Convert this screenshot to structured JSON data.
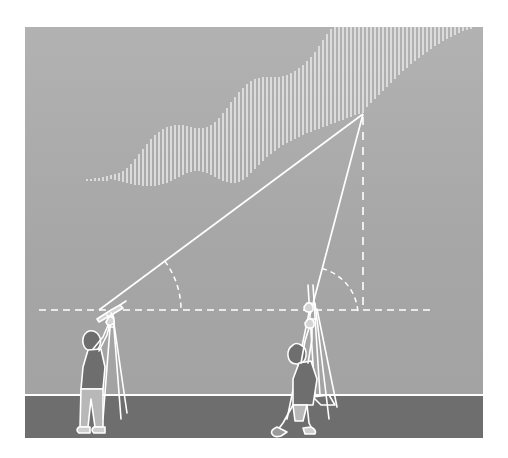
{
  "figure": {
    "background_color": "#a8a8a8",
    "sky_color": "#a8a8a8",
    "ground_color": "#6e6e6e",
    "line_color": "#ffffff",
    "hatch_color": "#e8e8e8",
    "canvas": {
      "width": 458,
      "height": 411,
      "offset_x": 25,
      "offset_y": 27
    }
  },
  "geometry": {
    "target_point": {
      "x": 338,
      "y": 87
    },
    "ground_line_y": 368,
    "horizontal_eye_line_y": 283,
    "horizontal_eye_line_x1": 14,
    "horizontal_eye_line_x2": 406,
    "vertical_drop_x": 338,
    "vertical_drop_y1": 90,
    "vertical_drop_y2": 283,
    "sightline_left": {
      "x1": 74,
      "y1": 283,
      "x2": 338,
      "y2": 87
    },
    "sightline_right": {
      "x1": 285,
      "y1": 288,
      "x2": 338,
      "y2": 87
    },
    "angle_arc_left": {
      "cx": 74,
      "cy": 283,
      "r": 82,
      "label": "elevation angle A"
    },
    "angle_arc_right": {
      "cx": 285,
      "cy": 288,
      "r": 48,
      "label": "elevation angle B"
    }
  },
  "surveyors": [
    {
      "id": "left-surveyor",
      "label": "Surveyor with transit on tripod",
      "instrument": "theodolite-transit",
      "base_x": 72,
      "base_y": 368,
      "shirt_color": "#6e6e6e"
    },
    {
      "id": "right-surveyor",
      "label": "Surveyor with leveling rod and tripod",
      "instrument": "leveling-rod",
      "base_x": 285,
      "base_y": 368,
      "shirt_color": "#6e6e6e"
    }
  ],
  "hillside": {
    "label": "Hatched hillside profile",
    "hatch_spacing": 4,
    "hatch_width": 1.6,
    "profile": [
      {
        "x": 86,
        "top": 148,
        "bottom": 152
      },
      {
        "x": 90,
        "top": 147,
        "bottom": 153
      },
      {
        "x": 94,
        "top": 146,
        "bottom": 154
      },
      {
        "x": 98,
        "top": 144,
        "bottom": 155
      },
      {
        "x": 102,
        "top": 141,
        "bottom": 156
      },
      {
        "x": 106,
        "top": 137,
        "bottom": 157
      },
      {
        "x": 110,
        "top": 132,
        "bottom": 158
      },
      {
        "x": 114,
        "top": 127,
        "bottom": 158
      },
      {
        "x": 118,
        "top": 122,
        "bottom": 159
      },
      {
        "x": 122,
        "top": 117,
        "bottom": 159
      },
      {
        "x": 126,
        "top": 112,
        "bottom": 159
      },
      {
        "x": 130,
        "top": 108,
        "bottom": 159
      },
      {
        "x": 134,
        "top": 105,
        "bottom": 158
      },
      {
        "x": 138,
        "top": 102,
        "bottom": 157
      },
      {
        "x": 142,
        "top": 100,
        "bottom": 156
      },
      {
        "x": 146,
        "top": 99,
        "bottom": 154
      },
      {
        "x": 150,
        "top": 98,
        "bottom": 152
      },
      {
        "x": 154,
        "top": 98,
        "bottom": 150
      },
      {
        "x": 158,
        "top": 98,
        "bottom": 148
      },
      {
        "x": 162,
        "top": 99,
        "bottom": 146
      },
      {
        "x": 166,
        "top": 100,
        "bottom": 145
      },
      {
        "x": 170,
        "top": 101,
        "bottom": 144
      },
      {
        "x": 174,
        "top": 101,
        "bottom": 144
      },
      {
        "x": 178,
        "top": 101,
        "bottom": 145
      },
      {
        "x": 182,
        "top": 100,
        "bottom": 146
      },
      {
        "x": 186,
        "top": 98,
        "bottom": 148
      },
      {
        "x": 190,
        "top": 95,
        "bottom": 150
      },
      {
        "x": 194,
        "top": 91,
        "bottom": 152
      },
      {
        "x": 198,
        "top": 86,
        "bottom": 154
      },
      {
        "x": 202,
        "top": 81,
        "bottom": 155
      },
      {
        "x": 206,
        "top": 75,
        "bottom": 156
      },
      {
        "x": 210,
        "top": 70,
        "bottom": 156
      },
      {
        "x": 214,
        "top": 65,
        "bottom": 155
      },
      {
        "x": 218,
        "top": 61,
        "bottom": 153
      },
      {
        "x": 222,
        "top": 57,
        "bottom": 150
      },
      {
        "x": 226,
        "top": 54,
        "bottom": 146
      },
      {
        "x": 230,
        "top": 52,
        "bottom": 142
      },
      {
        "x": 234,
        "top": 51,
        "bottom": 138
      },
      {
        "x": 238,
        "top": 50,
        "bottom": 134
      },
      {
        "x": 242,
        "top": 50,
        "bottom": 130
      },
      {
        "x": 246,
        "top": 50,
        "bottom": 127
      },
      {
        "x": 250,
        "top": 50,
        "bottom": 124
      },
      {
        "x": 254,
        "top": 50,
        "bottom": 121
      },
      {
        "x": 258,
        "top": 49,
        "bottom": 118
      },
      {
        "x": 262,
        "top": 48,
        "bottom": 116
      },
      {
        "x": 266,
        "top": 46,
        "bottom": 114
      },
      {
        "x": 270,
        "top": 44,
        "bottom": 112
      },
      {
        "x": 274,
        "top": 41,
        "bottom": 110
      },
      {
        "x": 278,
        "top": 38,
        "bottom": 108
      },
      {
        "x": 282,
        "top": 34,
        "bottom": 106
      },
      {
        "x": 286,
        "top": 30,
        "bottom": 105
      },
      {
        "x": 290,
        "top": 25,
        "bottom": 103
      },
      {
        "x": 294,
        "top": 19,
        "bottom": 102
      },
      {
        "x": 298,
        "top": 13,
        "bottom": 100
      },
      {
        "x": 302,
        "top": 7,
        "bottom": 99
      },
      {
        "x": 306,
        "top": 2,
        "bottom": 97
      },
      {
        "x": 310,
        "top": 0,
        "bottom": 96
      },
      {
        "x": 314,
        "top": 0,
        "bottom": 94
      },
      {
        "x": 318,
        "top": 0,
        "bottom": 93
      },
      {
        "x": 322,
        "top": 0,
        "bottom": 91
      },
      {
        "x": 326,
        "top": 0,
        "bottom": 90
      },
      {
        "x": 330,
        "top": 0,
        "bottom": 88
      },
      {
        "x": 334,
        "top": 0,
        "bottom": 87
      },
      {
        "x": 338,
        "top": 0,
        "bottom": 86
      },
      {
        "x": 342,
        "top": 0,
        "bottom": 80
      },
      {
        "x": 346,
        "top": 0,
        "bottom": 76
      },
      {
        "x": 350,
        "top": 0,
        "bottom": 72
      },
      {
        "x": 354,
        "top": 0,
        "bottom": 68
      },
      {
        "x": 358,
        "top": 0,
        "bottom": 64
      },
      {
        "x": 362,
        "top": 0,
        "bottom": 60
      },
      {
        "x": 366,
        "top": 0,
        "bottom": 56
      },
      {
        "x": 370,
        "top": 0,
        "bottom": 52
      },
      {
        "x": 374,
        "top": 0,
        "bottom": 48
      },
      {
        "x": 378,
        "top": 0,
        "bottom": 44
      },
      {
        "x": 382,
        "top": 0,
        "bottom": 41
      },
      {
        "x": 386,
        "top": 0,
        "bottom": 37
      },
      {
        "x": 390,
        "top": 0,
        "bottom": 34
      },
      {
        "x": 394,
        "top": 0,
        "bottom": 31
      },
      {
        "x": 398,
        "top": 0,
        "bottom": 28
      },
      {
        "x": 402,
        "top": 0,
        "bottom": 25
      },
      {
        "x": 406,
        "top": 0,
        "bottom": 22
      },
      {
        "x": 410,
        "top": 0,
        "bottom": 19
      },
      {
        "x": 414,
        "top": 0,
        "bottom": 17
      },
      {
        "x": 418,
        "top": 0,
        "bottom": 14
      },
      {
        "x": 422,
        "top": 0,
        "bottom": 12
      },
      {
        "x": 426,
        "top": 0,
        "bottom": 10
      },
      {
        "x": 430,
        "top": 0,
        "bottom": 8
      },
      {
        "x": 434,
        "top": 0,
        "bottom": 6
      },
      {
        "x": 438,
        "top": 0,
        "bottom": 4
      },
      {
        "x": 442,
        "top": 0,
        "bottom": 3
      },
      {
        "x": 446,
        "top": 0,
        "bottom": 2
      }
    ],
    "tail_dots": [
      {
        "x": 62,
        "y": 152,
        "h": 2
      },
      {
        "x": 66,
        "y": 152,
        "h": 2
      },
      {
        "x": 70,
        "y": 151,
        "h": 3
      },
      {
        "x": 74,
        "y": 151,
        "h": 3
      },
      {
        "x": 78,
        "y": 150,
        "h": 4
      },
      {
        "x": 82,
        "y": 149,
        "h": 5
      }
    ]
  }
}
